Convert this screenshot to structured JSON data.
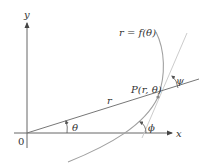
{
  "diagram": {
    "type": "polar-tangent-angle",
    "labels": {
      "y_axis": "y",
      "x_axis": "x",
      "origin": "0",
      "curve": "r = f(θ)",
      "point": "P(r, θ)",
      "radius": "r",
      "theta": "θ",
      "psi": "ψ",
      "phi": "ϕ"
    },
    "colors": {
      "axes": "#555555",
      "ray": "#666666",
      "curve": "#9a9a9a",
      "tangent": "#c8c8c8",
      "text": "#333333"
    }
  }
}
